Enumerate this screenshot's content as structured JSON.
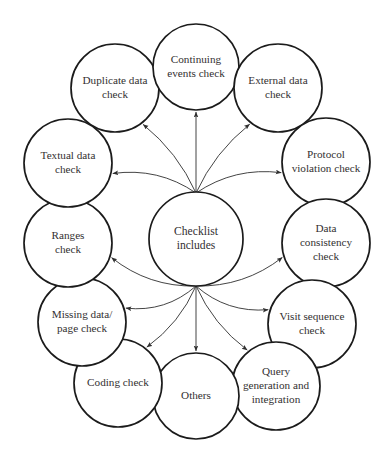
{
  "diagram": {
    "type": "radial-hub-and-spoke",
    "title_top_partial": "",
    "caption_bottom_partial": "",
    "hub": {
      "id": "checklist-includes",
      "label_lines": [
        "Checklist",
        "includes"
      ],
      "cx": 196,
      "cy": 239,
      "r": 47
    },
    "edge_style": {
      "direction": "hub-to-node",
      "arrowhead": "filled-triangle",
      "curve": "quadratic",
      "stroke_color": "#2f2f2f",
      "fan_point_top": {
        "x": 196,
        "y": 193
      },
      "fan_point_bottom": {
        "x": 196,
        "y": 286
      }
    },
    "nodes": [
      {
        "id": "duplicate-data-check",
        "label_lines": [
          "Duplicate data",
          "check"
        ],
        "cx": 115,
        "cy": 88,
        "r": 44,
        "fan": "top"
      },
      {
        "id": "continuing-events-check",
        "label_lines": [
          "Continuing",
          "events check"
        ],
        "cx": 196,
        "cy": 67,
        "r": 43,
        "fan": "top"
      },
      {
        "id": "external-data-check",
        "label_lines": [
          "External data",
          "check"
        ],
        "cx": 278,
        "cy": 88,
        "r": 44,
        "fan": "top"
      },
      {
        "id": "protocol-violation-check",
        "label_lines": [
          "Protocol",
          "violation check"
        ],
        "cx": 326,
        "cy": 162,
        "r": 44,
        "fan": "top"
      },
      {
        "id": "data-consistency-check",
        "label_lines": [
          "Data",
          "consistency",
          "check"
        ],
        "cx": 326,
        "cy": 243,
        "r": 44,
        "fan": "bottom"
      },
      {
        "id": "visit-sequence-check",
        "label_lines": [
          "Visit sequence",
          "check"
        ],
        "cx": 312,
        "cy": 324,
        "r": 44,
        "fan": "bottom"
      },
      {
        "id": "query-generation-and-integration",
        "label_lines": [
          "Query",
          "generation and",
          "integration"
        ],
        "cx": 276,
        "cy": 386,
        "r": 44,
        "fan": "bottom"
      },
      {
        "id": "others",
        "label_lines": [
          "Others"
        ],
        "cx": 196,
        "cy": 396,
        "r": 43,
        "fan": "bottom"
      },
      {
        "id": "coding-check",
        "label_lines": [
          "Coding check"
        ],
        "cx": 118,
        "cy": 383,
        "r": 44,
        "fan": "bottom"
      },
      {
        "id": "missing-data-page-check",
        "label_lines": [
          "Missing data/",
          "page check"
        ],
        "cx": 82,
        "cy": 322,
        "r": 44,
        "fan": "bottom"
      },
      {
        "id": "ranges-check",
        "label_lines": [
          "Ranges",
          "check"
        ],
        "cx": 68,
        "cy": 243,
        "r": 44,
        "fan": "bottom"
      },
      {
        "id": "textual-data-check",
        "label_lines": [
          "Textual data",
          "check"
        ],
        "cx": 68,
        "cy": 163,
        "r": 44,
        "fan": "top"
      }
    ]
  }
}
